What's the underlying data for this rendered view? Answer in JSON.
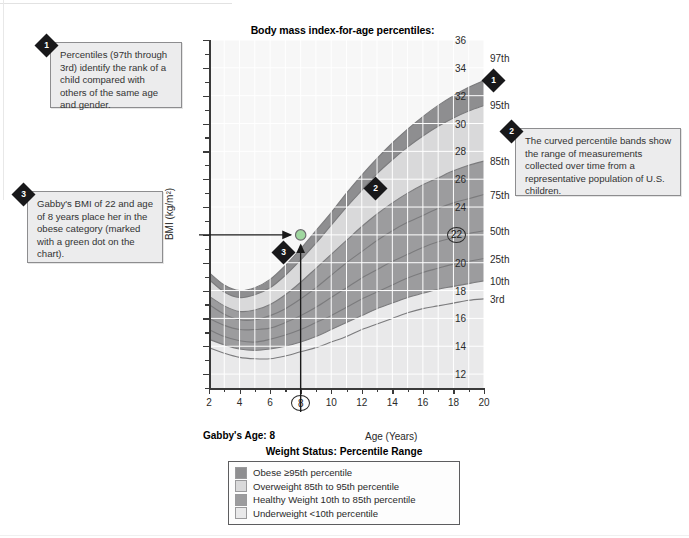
{
  "chart_data": {
    "type": "area",
    "title": "Body mass index-for-age percentiles:\nGirls, 2 to 20 years",
    "title_line1": "Body mass index-for-age percentiles:",
    "title_line2": "Girls, 2 to 20 years",
    "xlabel": "Age (Years)",
    "ylabel": "BMI (kg/m²)",
    "xlim": [
      2,
      20
    ],
    "ylim": [
      11,
      36
    ],
    "grid": true,
    "legend_position": "below-chart",
    "xticks": [
      2,
      4,
      6,
      8,
      10,
      12,
      14,
      16,
      18,
      20
    ],
    "yticks": [
      12,
      14,
      16,
      18,
      20,
      22,
      24,
      26,
      28,
      30,
      32,
      34,
      36
    ],
    "highlighted_xtick": "8",
    "highlighted_ytick": "22",
    "percentile_labels": [
      "97th",
      "95th",
      "85th",
      "75th",
      "50th",
      "25th",
      "10th",
      "3rd"
    ],
    "x": [
      2,
      3,
      4,
      5,
      6,
      7,
      8,
      9,
      10,
      11,
      12,
      13,
      14,
      15,
      16,
      17,
      18,
      19,
      20
    ],
    "series": [
      {
        "name": "97th",
        "values": [
          19.3,
          18.4,
          18.0,
          18.2,
          18.8,
          19.8,
          21.0,
          22.3,
          23.6,
          25.0,
          26.3,
          27.5,
          28.6,
          29.6,
          30.5,
          31.3,
          32.0,
          32.6,
          33.1
        ]
      },
      {
        "name": "95th",
        "values": [
          18.8,
          17.9,
          17.5,
          17.7,
          18.2,
          19.1,
          20.2,
          21.4,
          22.7,
          24.0,
          25.2,
          26.4,
          27.4,
          28.3,
          29.1,
          29.8,
          30.4,
          30.9,
          31.3
        ]
      },
      {
        "name": "85th",
        "values": [
          17.6,
          16.9,
          16.5,
          16.6,
          17.0,
          17.7,
          18.6,
          19.6,
          20.6,
          21.6,
          22.6,
          23.5,
          24.3,
          25.0,
          25.6,
          26.1,
          26.6,
          27.0,
          27.3
        ]
      },
      {
        "name": "75th",
        "values": [
          17.0,
          16.3,
          15.9,
          15.9,
          16.2,
          16.7,
          17.4,
          18.2,
          19.1,
          20.0,
          20.8,
          21.6,
          22.3,
          22.9,
          23.4,
          23.9,
          24.3,
          24.6,
          24.9
        ]
      },
      {
        "name": "50th",
        "values": [
          16.0,
          15.5,
          15.2,
          15.2,
          15.3,
          15.7,
          16.2,
          16.8,
          17.5,
          18.2,
          18.9,
          19.5,
          20.1,
          20.6,
          21.1,
          21.5,
          21.8,
          22.1,
          22.3
        ]
      },
      {
        "name": "25th",
        "values": [
          15.2,
          14.7,
          14.4,
          14.3,
          14.5,
          14.8,
          15.2,
          15.7,
          16.2,
          16.8,
          17.4,
          17.9,
          18.4,
          18.9,
          19.3,
          19.6,
          19.9,
          20.1,
          20.3
        ]
      },
      {
        "name": "10th",
        "values": [
          14.5,
          14.1,
          13.8,
          13.7,
          13.8,
          14.0,
          14.3,
          14.7,
          15.2,
          15.7,
          16.2,
          16.7,
          17.1,
          17.5,
          17.8,
          18.1,
          18.3,
          18.5,
          18.7
        ]
      },
      {
        "name": "3rd",
        "values": [
          13.9,
          13.5,
          13.2,
          13.1,
          13.1,
          13.3,
          13.6,
          13.9,
          14.3,
          14.7,
          15.2,
          15.6,
          16.0,
          16.4,
          16.7,
          16.9,
          17.1,
          17.3,
          17.4
        ]
      }
    ],
    "marker_point": {
      "label": "Gabby",
      "x": 8,
      "y": 22,
      "color": "#9fd79f"
    },
    "annotations": {
      "gabby_age": "Gabby's Age: 8"
    }
  },
  "callouts": [
    {
      "number": "1",
      "text": "Percentiles (97th through 3rd) identify the rank of a child compared with others of the same age and gender."
    },
    {
      "number": "2",
      "text": "The curved percentile bands show the range of measurements collected over time from a representative population of U.S. children."
    },
    {
      "number": "3",
      "text": "Gabby's BMI of 22 and age of 8 years place her in the obese category (marked with a green dot on the chart)."
    }
  ],
  "chart_markers": [
    {
      "number": "1"
    },
    {
      "number": "2"
    },
    {
      "number": "3"
    }
  ],
  "legend": {
    "title": "Weight Status: Percentile Range",
    "items": [
      {
        "label": "Obese ≥95th percentile",
        "color": "#8e8e90"
      },
      {
        "label": "Overweight 85th to 95th percentile",
        "color": "#d9d9da"
      },
      {
        "label": "Healthy Weight 10th to 85th percentile",
        "color": "#9c9c9e"
      },
      {
        "label": "Underweight <10th percentile",
        "color": "#e9e9ea"
      }
    ]
  },
  "colors": {
    "obese": "#8e8e90",
    "overweight": "#d9d9da",
    "healthy": "#9c9c9e",
    "underweight": "#e9e9ea",
    "plot_bg": "#f2f2f2",
    "grid": "#ffffff",
    "axis": "#3a3a3a",
    "marker_dot": "#9fd79f"
  }
}
